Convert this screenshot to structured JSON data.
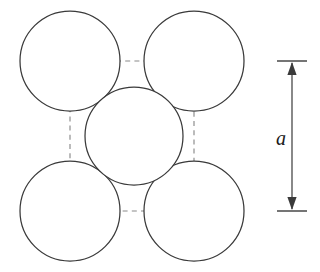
{
  "figure": {
    "background_color": "#ffffff",
    "width": 320,
    "height": 272
  },
  "chart_data": {
    "type": "diagram",
    "xlabel": "",
    "ylabel": "",
    "xlim": [
      0,
      320
    ],
    "ylim": [
      0,
      272
    ],
    "grid": false,
    "legend": null,
    "atoms": [
      {
        "name": "corner-atom-top-left",
        "cx": 70,
        "cy": 61,
        "r": 50
      },
      {
        "name": "corner-atom-top-right",
        "cx": 194,
        "cy": 61,
        "r": 50
      },
      {
        "name": "corner-atom-bottom-left",
        "cx": 70,
        "cy": 211,
        "r": 50
      },
      {
        "name": "corner-atom-bottom-right",
        "cx": 194,
        "cy": 211,
        "r": 50
      },
      {
        "name": "body-center-atom",
        "cx": 134,
        "cy": 136,
        "r": 49
      }
    ],
    "unit_cell": {
      "name": "unit-cell-outline",
      "x": 70,
      "y": 61,
      "width": 124,
      "height": 150,
      "style": "dashed",
      "stroke_color": "#8a8a8a"
    },
    "dimension": {
      "name": "lattice-parameter",
      "label": "a",
      "orientation": "vertical",
      "x": 292,
      "y_top": 61,
      "y_bottom": 211,
      "cap_half_width": 15,
      "label_x": 281,
      "label_y": 140,
      "stroke_color": "#3a3a3a"
    }
  },
  "colors": {
    "sphere_stroke": "#3a3a3a",
    "sphere_fill": "#ffffff",
    "cell_stroke": "#8a8a8a",
    "dimension_stroke": "#3a3a3a",
    "label_color": "#1a1a1a"
  }
}
